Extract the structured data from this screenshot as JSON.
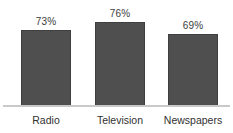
{
  "chart_data": {
    "type": "bar",
    "title": "",
    "subtitle": "",
    "xlabel": "",
    "ylabel": "",
    "categories": [
      "Radio",
      "Television",
      "Newspapers"
    ],
    "values": [
      73,
      76,
      69
    ],
    "value_labels": [
      "73%",
      "76%",
      "69%"
    ],
    "ylim": [
      0,
      100
    ],
    "grid": false,
    "legend": false,
    "legend_position": "none",
    "orientation": "vertical",
    "bar_color": "#4f4f4f",
    "bar_border_color": "#3f3f3f",
    "value_label_color": "#3c3c3c",
    "category_label_color": "#313131",
    "axis_line_color": "#c9c9c9",
    "background_color": "#ffffff"
  }
}
